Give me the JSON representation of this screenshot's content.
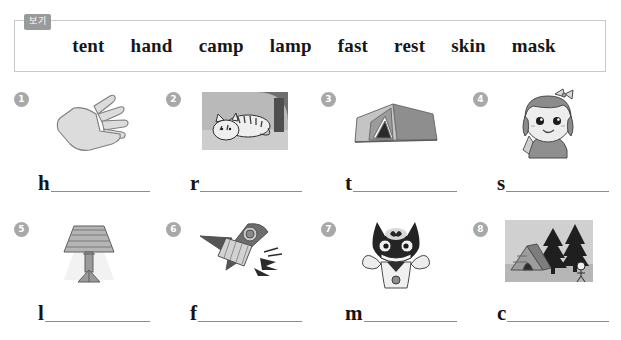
{
  "word_bank": {
    "tag_label": "보기",
    "words": [
      "tent",
      "hand",
      "camp",
      "lamp",
      "fast",
      "rest",
      "skin",
      "mask"
    ]
  },
  "items": [
    {
      "number": "1",
      "letter": "h",
      "picture": "hand-illustration",
      "answer_word": "hand"
    },
    {
      "number": "2",
      "letter": "r",
      "picture": "resting-cat-photo",
      "answer_word": "rest"
    },
    {
      "number": "3",
      "letter": "t",
      "picture": "tent-illustration",
      "answer_word": "tent"
    },
    {
      "number": "4",
      "letter": "s",
      "picture": "girl-skin-illustration",
      "answer_word": "skin"
    },
    {
      "number": "5",
      "letter": "l",
      "picture": "lamp-illustration",
      "answer_word": "lamp"
    },
    {
      "number": "6",
      "letter": "f",
      "picture": "fast-rocket-illustration",
      "answer_word": "fast"
    },
    {
      "number": "7",
      "letter": "m",
      "picture": "child-wearing-mask-illustration",
      "answer_word": "mask"
    },
    {
      "number": "8",
      "letter": "c",
      "picture": "campsite-photo",
      "answer_word": "camp"
    }
  ],
  "colors": {
    "border": "#c9c9c9",
    "tag_background": "#9a9a9a",
    "badge_background": "#a8a8a8",
    "blank_line": "#8d8d8d",
    "text": "#171717"
  }
}
